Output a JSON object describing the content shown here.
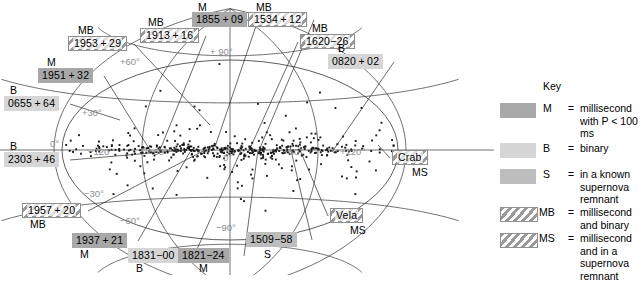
{
  "chart_data": {
    "type": "scatter",
    "projection": "aitoff",
    "xlabel": "Galactic longitude",
    "ylabel": "Galactic latitude",
    "grid": true,
    "xlim": [
      -180,
      180
    ],
    "ylim": [
      -90,
      90
    ],
    "longitude_ticks": [
      "-120°",
      "-60°",
      "0°",
      "+60°",
      "+120°"
    ],
    "latitude_ticks": [
      "+90°",
      "+60°",
      "+30°",
      "0°",
      "-30°",
      "-60°",
      "-90°"
    ],
    "point_count": 558,
    "point_color": "#1a1a1a",
    "annotated_points": [
      {
        "name": "1953+29",
        "code": "MB",
        "l": -48,
        "b": 35
      },
      {
        "name": "1951+32",
        "code": "M",
        "l": -66,
        "b": 20
      },
      {
        "name": "0655+64",
        "code": "B",
        "l": -92,
        "b": 8
      },
      {
        "name": "2303+46",
        "code": "B",
        "l": -96,
        "b": -6
      },
      {
        "name": "1957+20",
        "code": "MB",
        "l": -62,
        "b": -27
      },
      {
        "name": "1937+21",
        "code": "M",
        "l": -40,
        "b": -40
      },
      {
        "name": "1913+16",
        "code": "MB",
        "l": -26,
        "b": 58
      },
      {
        "name": "1831-00",
        "code": "B",
        "l": -8,
        "b": -46
      },
      {
        "name": "1821-24",
        "code": "M",
        "l": 3,
        "b": -62
      },
      {
        "name": "1855+09",
        "code": "M",
        "l": 10,
        "b": 68
      },
      {
        "name": "1534+12",
        "code": "MB",
        "l": 32,
        "b": 44
      },
      {
        "name": "1620-26",
        "code": "MB",
        "l": 52,
        "b": 30
      },
      {
        "name": "0820+02",
        "code": "B",
        "l": 86,
        "b": 14
      },
      {
        "name": "1509-58",
        "code": "S",
        "l": 38,
        "b": -54
      },
      {
        "name": "Vela",
        "code": "MS",
        "l": 100,
        "b": -36
      },
      {
        "name": "Crab",
        "code": "MS",
        "l": 126,
        "b": -4
      }
    ]
  },
  "map": {
    "labels": [
      {
        "name": "1953+29",
        "code": "MB",
        "code_pos": "top"
      },
      {
        "name": "1951+32",
        "code": "M",
        "code_pos": "top"
      },
      {
        "name": "0655+64",
        "code": "B",
        "code_pos": "top"
      },
      {
        "name": "2303+46",
        "code": "B",
        "code_pos": "top"
      },
      {
        "name": "1957+20",
        "code": "MB",
        "code_pos": "bottom"
      },
      {
        "name": "1937+21",
        "code": "M",
        "code_pos": "bottom"
      },
      {
        "name": "1913+16",
        "code": "MB",
        "code_pos": "top"
      },
      {
        "name": "1831-00",
        "code": "B",
        "code_pos": "bottom"
      },
      {
        "name": "1821-24",
        "code": "M",
        "code_pos": "bottom"
      },
      {
        "name": "1855+09",
        "code": "M",
        "code_pos": "top"
      },
      {
        "name": "1534+12",
        "code": "MB",
        "code_pos": "top"
      },
      {
        "name": "1620-26",
        "code": "MB",
        "code_pos": "top"
      },
      {
        "name": "0820+02",
        "code": "B",
        "code_pos": "top"
      },
      {
        "name": "1509-58",
        "code": "S",
        "code_pos": "bottom"
      },
      {
        "name": "Vela",
        "code": "MS",
        "code_pos": "bottom"
      },
      {
        "name": "Crab",
        "code": "MS",
        "code_pos": "bottom"
      }
    ],
    "grid_labels": {
      "lat_p90": "+ 90°",
      "lat_p60": "+60°",
      "lat_p30": "+30°",
      "lat_0": "0°",
      "lat_m30": "−30°",
      "lat_m60": "−60°",
      "lat_m90": "−90°",
      "lon_m120": "−120°",
      "lon_m60": "−60°",
      "lon_0": "0°",
      "lon_p60": "+60°",
      "lon_p120": "+120°"
    }
  },
  "key": {
    "title": "Key",
    "entries": [
      {
        "code": "M",
        "eq": "=",
        "desc": "millisecond with P < 100 ms",
        "swatch": "m"
      },
      {
        "code": "B",
        "eq": "=",
        "desc": "binary",
        "swatch": "b"
      },
      {
        "code": "S",
        "eq": "=",
        "desc": "in a known supernova remnant",
        "swatch": "s"
      },
      {
        "code": "MB",
        "eq": "=",
        "desc": "millisecond and binary",
        "swatch": "mb"
      },
      {
        "code": "MS",
        "eq": "=",
        "desc": "millisecond and in a supernova remnant",
        "swatch": "ms"
      }
    ]
  },
  "colors": {
    "swatch_m": "#a8a8a8",
    "swatch_b": "#d6d6d6",
    "swatch_s": "#bdbdbd",
    "hatch_line": "#9a9a9a",
    "grid": "#4a4a4a",
    "grid_label": "#8d8d8d",
    "point": "#1a1a1a",
    "background": "#ffffff"
  }
}
